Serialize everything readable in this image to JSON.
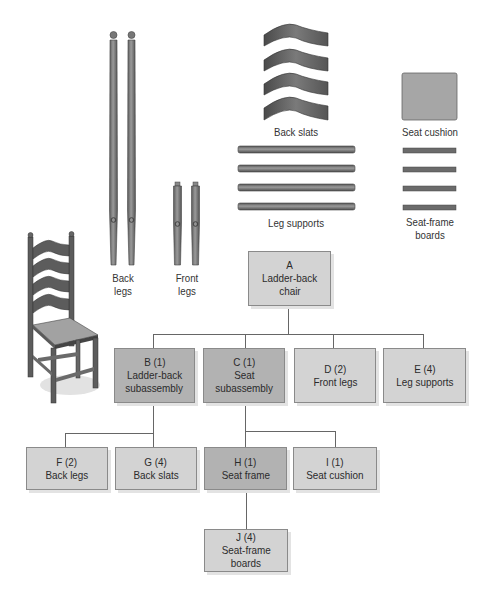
{
  "parts": {
    "back_legs": {
      "label_line1": "Back",
      "label_line2": "legs",
      "count": 2
    },
    "front_legs": {
      "label_line1": "Front",
      "label_line2": "legs",
      "count": 2
    },
    "back_slats": {
      "label": "Back slats",
      "count": 4
    },
    "seat_cushion": {
      "label": "Seat cushion",
      "count": 1
    },
    "leg_supports": {
      "label": "Leg supports",
      "count": 4
    },
    "seat_frame_boards": {
      "label_line1": "Seat-frame",
      "label_line2": "boards",
      "count": 4
    }
  },
  "tree": {
    "A": {
      "line1": "A",
      "line2": "Ladder-back",
      "line3": "chair",
      "level": 0
    },
    "B": {
      "line1": "B (1)",
      "line2": "Ladder-back",
      "line3": "subassembly",
      "level": 1,
      "parent": "A"
    },
    "C": {
      "line1": "C (1)",
      "line2": "Seat",
      "line3": "subassembly",
      "level": 1,
      "parent": "A"
    },
    "D": {
      "line1": "D (2)",
      "line2": "Front legs",
      "level": 1,
      "parent": "A"
    },
    "E": {
      "line1": "E (4)",
      "line2": "Leg supports",
      "level": 1,
      "parent": "A"
    },
    "F": {
      "line1": "F (2)",
      "line2": "Back legs",
      "level": 2,
      "parent": "B"
    },
    "G": {
      "line1": "G (4)",
      "line2": "Back slats",
      "level": 2,
      "parent": "B"
    },
    "H": {
      "line1": "H (1)",
      "line2": "Seat frame",
      "level": 2,
      "parent": "C"
    },
    "I": {
      "line1": "I (1)",
      "line2": "Seat cushion",
      "level": 2,
      "parent": "C"
    },
    "J": {
      "line1": "J (4)",
      "line2": "Seat-frame",
      "line3": "boards",
      "level": 3,
      "parent": "H"
    }
  },
  "colors": {
    "leaf_fill": "#d3d3d3",
    "subassembly_fill": "#b2b2b2",
    "connector": "#666666",
    "part_fill": "#6f6f6f"
  }
}
